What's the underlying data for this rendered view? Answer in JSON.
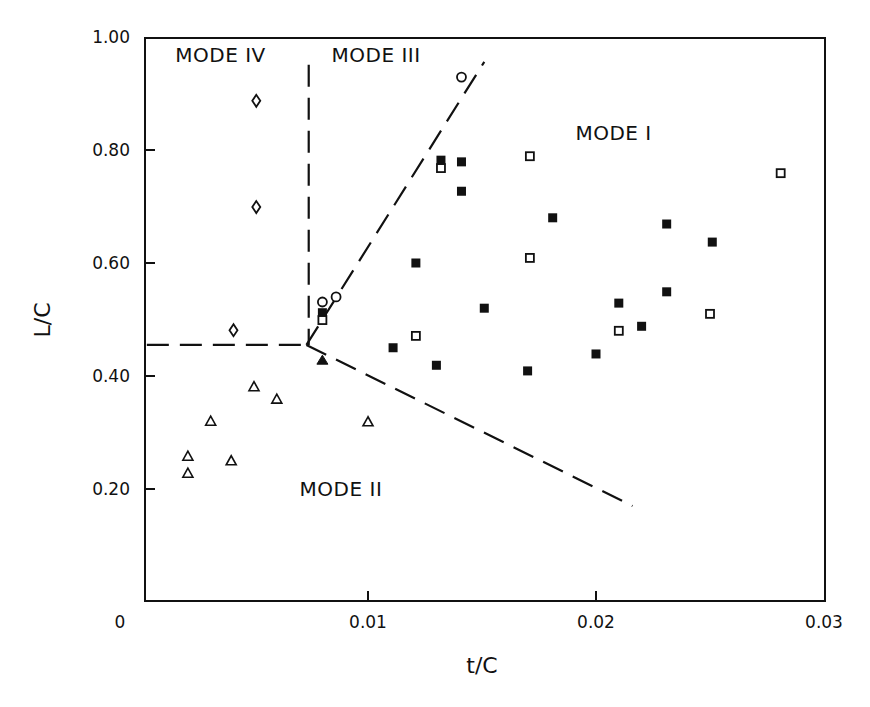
{
  "chart_data": {
    "type": "scatter",
    "title": "",
    "xlabel": "t/C",
    "ylabel": "L/C",
    "xlim": [
      0,
      0.03
    ],
    "ylim": [
      0,
      1.0
    ],
    "x_ticks": [
      {
        "value": 0,
        "label": "0"
      },
      {
        "value": 0.01,
        "label": "0.01"
      },
      {
        "value": 0.02,
        "label": "0.02"
      },
      {
        "value": 0.03,
        "label": "0.03"
      }
    ],
    "y_ticks": [
      {
        "value": 0.2,
        "label": "0.20"
      },
      {
        "value": 0.4,
        "label": "0.40"
      },
      {
        "value": 0.6,
        "label": "0.60"
      },
      {
        "value": 0.8,
        "label": "0.80"
      },
      {
        "value": 1.0,
        "label": "1.00"
      }
    ],
    "grid": false,
    "legend": null,
    "series": [
      {
        "name": "open-triangle",
        "marker": "triangle-open",
        "points": [
          [
            0.0021,
            0.258
          ],
          [
            0.0021,
            0.228
          ],
          [
            0.0031,
            0.32
          ],
          [
            0.004,
            0.25
          ],
          [
            0.005,
            0.381
          ],
          [
            0.006,
            0.359
          ],
          [
            0.01,
            0.319
          ]
        ]
      },
      {
        "name": "filled-triangle",
        "marker": "triangle-filled",
        "points": [
          [
            0.008,
            0.428
          ]
        ]
      },
      {
        "name": "open-diamond",
        "marker": "diamond-open",
        "points": [
          [
            0.0051,
            0.887
          ],
          [
            0.0051,
            0.699
          ],
          [
            0.0041,
            0.481
          ]
        ]
      },
      {
        "name": "open-circle",
        "marker": "circle-open",
        "points": [
          [
            0.0141,
            0.929
          ],
          [
            0.008,
            0.531
          ],
          [
            0.0086,
            0.54
          ]
        ]
      },
      {
        "name": "filled-square",
        "marker": "square-filled",
        "points": [
          [
            0.0132,
            0.782
          ],
          [
            0.0141,
            0.779
          ],
          [
            0.0141,
            0.727
          ],
          [
            0.0181,
            0.68
          ],
          [
            0.0121,
            0.6
          ],
          [
            0.008,
            0.512
          ],
          [
            0.0151,
            0.52
          ],
          [
            0.0111,
            0.45
          ],
          [
            0.013,
            0.419
          ],
          [
            0.017,
            0.409
          ],
          [
            0.0231,
            0.669
          ],
          [
            0.0251,
            0.637
          ],
          [
            0.0231,
            0.549
          ],
          [
            0.021,
            0.529
          ],
          [
            0.022,
            0.488
          ],
          [
            0.02,
            0.439
          ]
        ]
      },
      {
        "name": "open-square",
        "marker": "square-open",
        "points": [
          [
            0.0132,
            0.768
          ],
          [
            0.0171,
            0.789
          ],
          [
            0.0171,
            0.609
          ],
          [
            0.008,
            0.499
          ],
          [
            0.0121,
            0.471
          ],
          [
            0.0281,
            0.759
          ],
          [
            0.025,
            0.51
          ],
          [
            0.021,
            0.48
          ]
        ]
      }
    ],
    "boundary_lines": [
      {
        "name": "horizontal-boundary",
        "style": "dashed",
        "from": [
          0.0003,
          0.455
        ],
        "to": [
          0.0073,
          0.455
        ]
      },
      {
        "name": "vertical-boundary",
        "style": "dashed",
        "from": [
          0.0074,
          0.951
        ],
        "to": [
          0.0074,
          0.455
        ]
      },
      {
        "name": "upper-diagonal-boundary",
        "style": "dashed",
        "from": [
          0.0073,
          0.455
        ],
        "to": [
          0.0151,
          0.956
        ]
      },
      {
        "name": "lower-diagonal-boundary",
        "style": "dashed",
        "from": [
          0.0073,
          0.455
        ],
        "to": [
          0.0216,
          0.17
        ]
      }
    ],
    "annotations": [
      {
        "id": "mode-iv",
        "text": "MODE IV",
        "x": 0.00155,
        "y": 0.955
      },
      {
        "id": "mode-iii",
        "text": "MODE III",
        "x": 0.0084,
        "y": 0.955
      },
      {
        "id": "mode-i",
        "text": "MODE I",
        "x": 0.0191,
        "y": 0.818
      },
      {
        "id": "mode-ii",
        "text": "MODE II",
        "x": 0.007,
        "y": 0.188
      }
    ]
  }
}
